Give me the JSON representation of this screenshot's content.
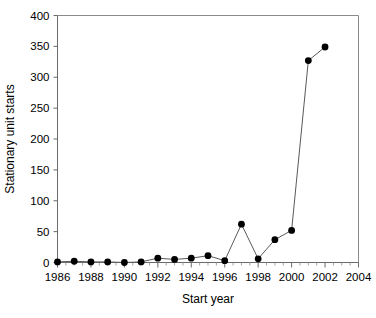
{
  "chart_data": {
    "type": "line",
    "title": "",
    "xlabel": "Start year",
    "ylabel": "Stationary unit starts",
    "xlim": [
      1986,
      2004
    ],
    "ylim": [
      0,
      400
    ],
    "grid": false,
    "legend": null,
    "x_ticks": [
      1986,
      1988,
      1990,
      1992,
      1994,
      1996,
      1998,
      2000,
      2002,
      2004
    ],
    "x_tick_labels": [
      "1986",
      "1988",
      "1990",
      "1992",
      "1994",
      "1996",
      "1998",
      "2000",
      "2002",
      "2004"
    ],
    "x_minor_tick_step": 1,
    "y_ticks": [
      0,
      50,
      100,
      150,
      200,
      250,
      300,
      350,
      400
    ],
    "y_tick_labels": [
      "0",
      "50",
      "100",
      "150",
      "200",
      "250",
      "300",
      "350",
      "400"
    ],
    "marker": "filled-circle",
    "marker_color": "#000000",
    "line_color": "#5a5a5a",
    "x": [
      1986,
      1987,
      1988,
      1989,
      1990,
      1991,
      1992,
      1993,
      1994,
      1995,
      1996,
      1997,
      1998,
      1999,
      2000,
      2001,
      2002
    ],
    "values": [
      1,
      2,
      1,
      1,
      0,
      1,
      7,
      5,
      7,
      11,
      3,
      62,
      6,
      37,
      52,
      327,
      349
    ],
    "series": [
      {
        "name": "Stationary unit starts",
        "x": [
          1986,
          1987,
          1988,
          1989,
          1990,
          1991,
          1992,
          1993,
          1994,
          1995,
          1996,
          1997,
          1998,
          1999,
          2000,
          2001,
          2002
        ],
        "values": [
          1,
          2,
          1,
          1,
          0,
          1,
          7,
          5,
          7,
          11,
          3,
          62,
          6,
          37,
          52,
          327,
          349
        ]
      }
    ]
  },
  "axes": {
    "x_title": "Start year",
    "y_title": "Stationary unit starts"
  }
}
